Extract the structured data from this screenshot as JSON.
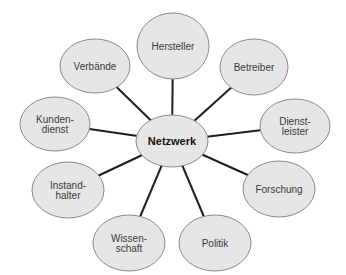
{
  "diagram": {
    "type": "hub-and-spoke",
    "center": {
      "label": "Netzwerk",
      "cx": 172,
      "cy": 141,
      "rx": 36,
      "ry": 26
    },
    "nodes": [
      {
        "id": "hersteller",
        "lines": [
          "Hersteller"
        ],
        "cx": 173,
        "cy": 46,
        "rx": 36,
        "ry": 33
      },
      {
        "id": "betreiber",
        "lines": [
          "Betreiber"
        ],
        "cx": 254,
        "cy": 67,
        "rx": 34,
        "ry": 28
      },
      {
        "id": "dienstleister",
        "lines": [
          "Dienst-",
          "leister"
        ],
        "cx": 295,
        "cy": 126,
        "rx": 35,
        "ry": 27
      },
      {
        "id": "forschung",
        "lines": [
          "Forschung"
        ],
        "cx": 279,
        "cy": 189,
        "rx": 36,
        "ry": 28
      },
      {
        "id": "politik",
        "lines": [
          "Politik"
        ],
        "cx": 215,
        "cy": 243,
        "rx": 36,
        "ry": 28
      },
      {
        "id": "wissenschaft",
        "lines": [
          "Wissen-",
          "schaft"
        ],
        "cx": 129,
        "cy": 243,
        "rx": 36,
        "ry": 28
      },
      {
        "id": "instandhalter",
        "lines": [
          "Instand-",
          "halter"
        ],
        "cx": 68,
        "cy": 190,
        "rx": 36,
        "ry": 28
      },
      {
        "id": "kundendienst",
        "lines": [
          "Kunden-",
          "dienst"
        ],
        "cx": 55,
        "cy": 124,
        "rx": 35,
        "ry": 27
      },
      {
        "id": "verbaende",
        "lines": [
          "Verbände"
        ],
        "cx": 95,
        "cy": 66,
        "rx": 35,
        "ry": 27
      }
    ],
    "colors": {
      "node_fill": "#e6e6e6",
      "node_stroke": "#8a8a8a",
      "edge": "#1e1e1e",
      "text": "#3a3a3a",
      "center_text": "#111111"
    }
  }
}
